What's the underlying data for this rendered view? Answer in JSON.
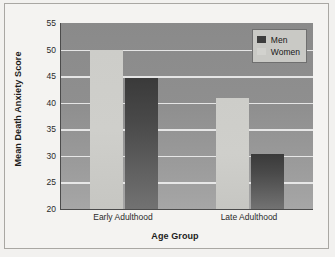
{
  "chart_data": {
    "type": "bar",
    "title": "",
    "xlabel": "Age Group",
    "ylabel": "Mean Death Anxiety Score",
    "categories": [
      "Early Adulthood",
      "Late Adulthood"
    ],
    "series": [
      {
        "name": "Women",
        "color": "#cdcdc9",
        "values": [
          50.0,
          40.9
        ]
      },
      {
        "name": "Men",
        "color": "#3d3d3d",
        "values": [
          44.7,
          30.4
        ]
      }
    ],
    "ylim": [
      20,
      55
    ],
    "yticks": [
      20,
      25,
      30,
      35,
      40,
      45,
      50,
      55
    ],
    "grid": true,
    "legend_position": "top-right",
    "legend_entries": [
      "Men",
      "Women"
    ],
    "plot_background": "#8d8d8d",
    "gridline_color": "#ededed",
    "axis_color": "#4b4b4b"
  }
}
